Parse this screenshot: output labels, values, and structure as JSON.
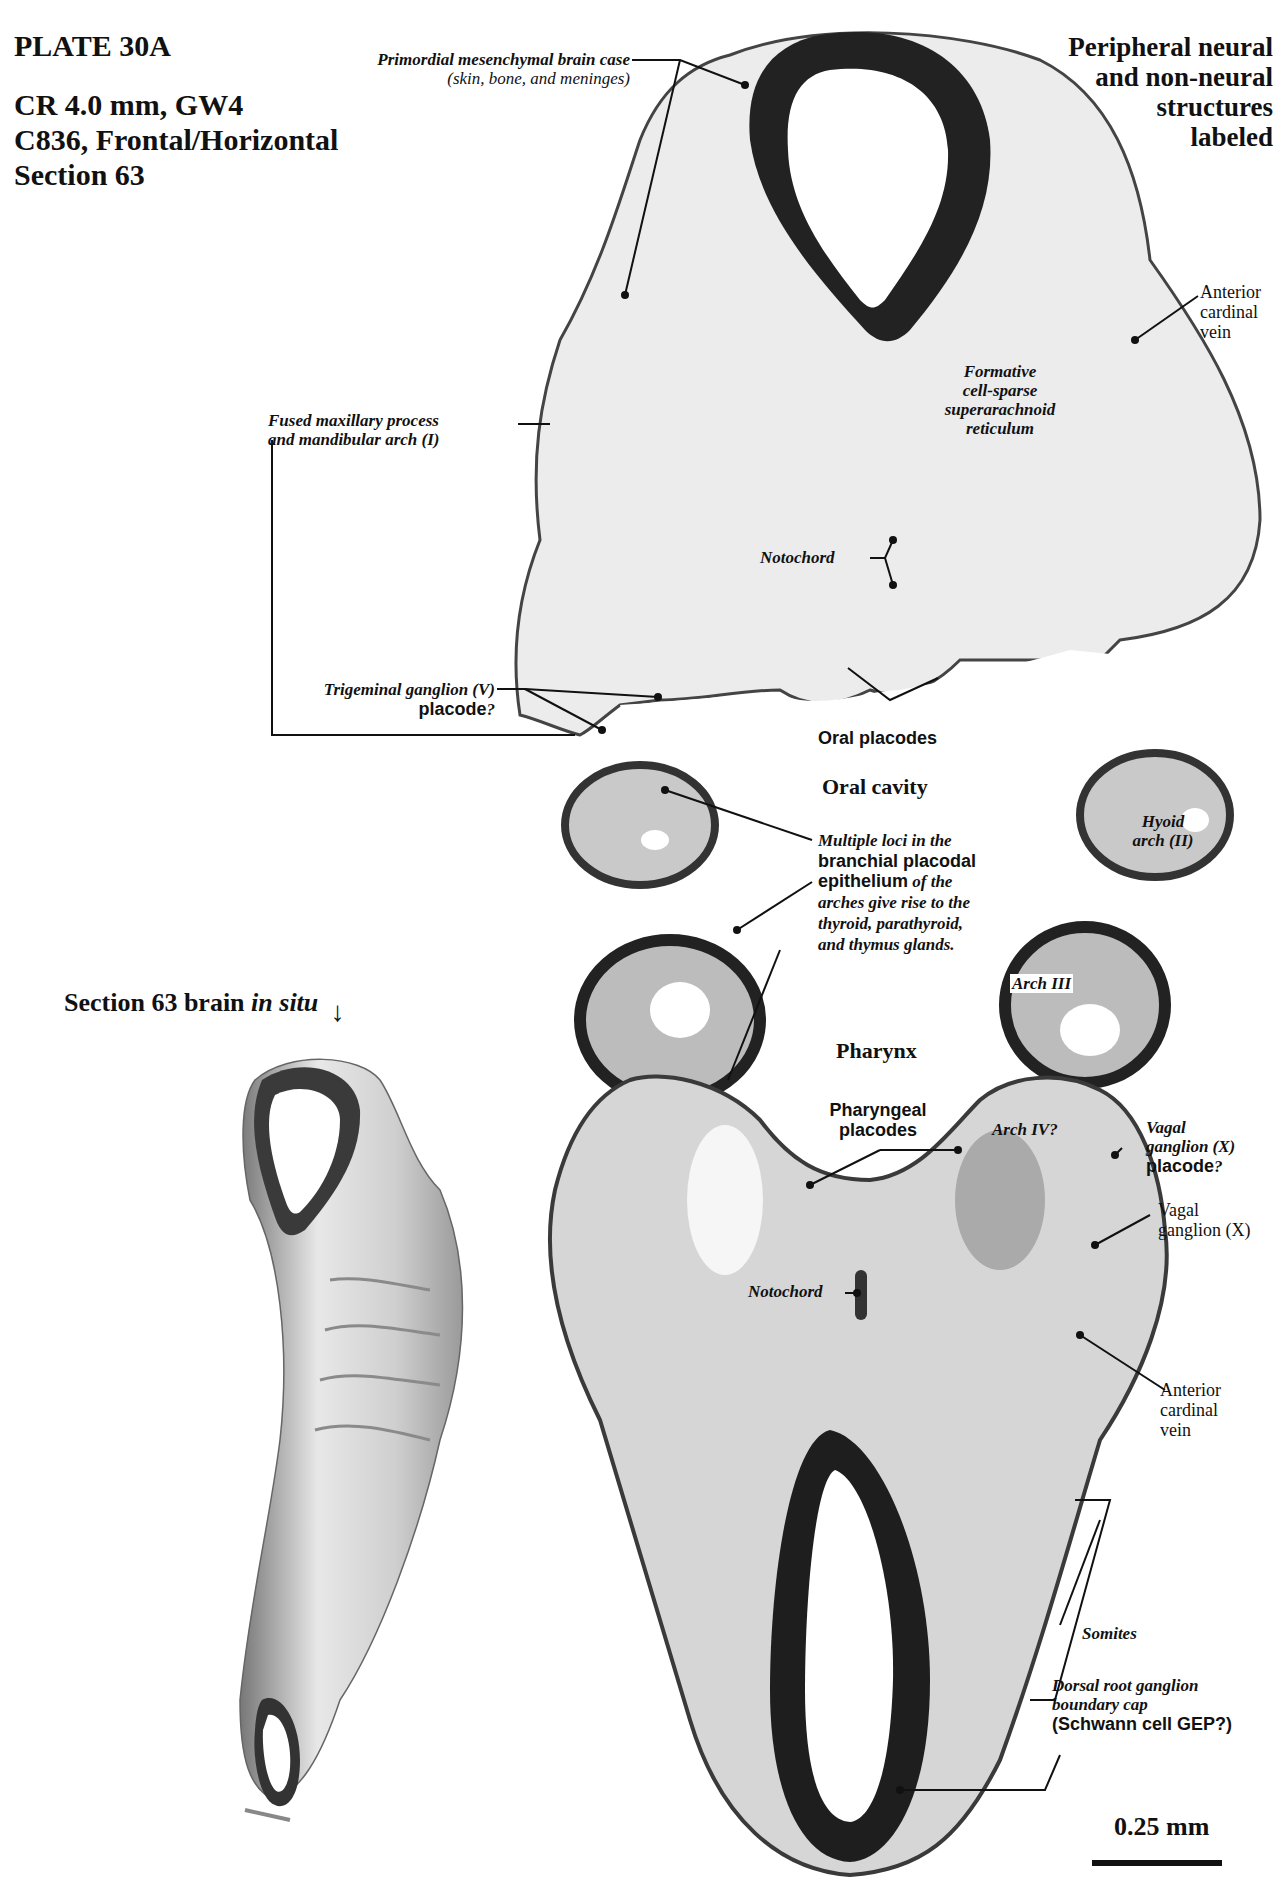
{
  "plate": {
    "title": "PLATE 30A",
    "specimen_line1": "CR 4.0 mm, GW4",
    "specimen_line2": "C836, Frontal/Horizontal",
    "specimen_line3": "Section 63"
  },
  "heading_right": {
    "line1": "Peripheral neural",
    "line2": "and non-neural",
    "line3": "structures",
    "line4": "labeled"
  },
  "labels": {
    "brain_case_1": "Primordial mesenchymal brain case",
    "brain_case_2": "(skin, bone, and meninges)",
    "acv_top_1": "Anterior",
    "acv_top_2": "cardinal",
    "acv_top_3": "vein",
    "formative_1": "Formative",
    "formative_2": "cell-sparse",
    "formative_3": "superarachnoid",
    "formative_4": "reticulum",
    "maxillary_1": "Fused maxillary process",
    "maxillary_2": "and mandibular arch (I)",
    "notochord_top": "Notochord",
    "trigeminal_1": "Trigeminal ganglion (V)",
    "trigeminal_2": "placode",
    "trigeminal_q": "?",
    "oral_placodes": "Oral placodes",
    "oral_cavity": "Oral cavity",
    "hyoid_1": "Hyoid",
    "hyoid_2": "arch (II)",
    "multiple_1": "Multiple loci in the",
    "multiple_2": "branchial placodal",
    "multiple_3a": "epithelium",
    "multiple_3b": " of the",
    "multiple_4": "arches give rise to the",
    "multiple_5": "thyroid, parathyroid,",
    "multiple_6": "and thymus glands.",
    "arch3": "Arch III",
    "pharynx": "Pharynx",
    "pharyngeal_1": "Pharyngeal",
    "pharyngeal_2": "placodes",
    "arch4": "Arch IV?",
    "vagal_plac_1": "Vagal",
    "vagal_plac_2": "ganglion (X)",
    "vagal_plac_3": "placode",
    "vagal_plac_q": "?",
    "vagal_1": "Vagal",
    "vagal_2": "ganglion (X)",
    "notochord_bottom": "Notochord",
    "acv_bot_1": "Anterior",
    "acv_bot_2": "cardinal",
    "acv_bot_3": "vein",
    "somites": "Somites",
    "drg_1": "Dorsal root ganglion",
    "drg_2": "boundary cap",
    "drg_3": "(Schwann cell GEP?)"
  },
  "inset": {
    "title_a": "Section 63 brain ",
    "title_b": "in situ",
    "arrow_icon": "down-arrow-icon"
  },
  "scale_bar": {
    "label": "0.25 mm"
  },
  "colors": {
    "tissue_dark": "#1a1a1a",
    "tissue_light": "#e6e6e6",
    "background": "#ffffff"
  }
}
